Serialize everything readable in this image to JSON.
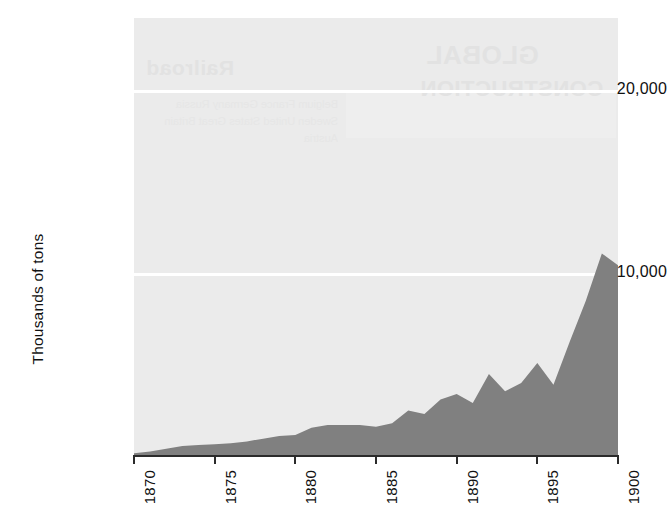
{
  "chart_data": {
    "type": "area",
    "title": "",
    "subtitle": "",
    "xlabel": "",
    "ylabel": "Thousands of tons",
    "xlim": [
      1870,
      1900
    ],
    "ylim": [
      0,
      24000
    ],
    "grid": true,
    "legend": "none",
    "fill_color": "#808080",
    "panel_color": "#ebebeb",
    "gridline_color": "#ffffff",
    "x_tick_labels": [
      "1870",
      "1875",
      "1880",
      "1885",
      "1890",
      "1895",
      "1900"
    ],
    "x_tick_values": [
      1870,
      1875,
      1880,
      1885,
      1890,
      1895,
      1900
    ],
    "y_tick_labels": [
      "20,000",
      "10,000"
    ],
    "y_tick_values": [
      20000,
      10000
    ],
    "x": [
      1870,
      1871,
      1872,
      1873,
      1874,
      1875,
      1876,
      1877,
      1878,
      1879,
      1880,
      1881,
      1882,
      1883,
      1884,
      1885,
      1886,
      1887,
      1888,
      1889,
      1890,
      1891,
      1892,
      1893,
      1894,
      1895,
      1896,
      1897,
      1898,
      1899,
      1900
    ],
    "values": [
      150,
      250,
      400,
      550,
      600,
      650,
      700,
      800,
      950,
      1100,
      1150,
      1550,
      1700,
      1700,
      1700,
      1600,
      1800,
      2500,
      2300,
      3100,
      3400,
      2900,
      4500,
      3550,
      4000,
      5100,
      3900,
      6250,
      8500,
      11100,
      10450
    ],
    "series": [
      {
        "name": "Steel production",
        "values": [
          150,
          250,
          400,
          550,
          600,
          650,
          700,
          800,
          950,
          1100,
          1150,
          1550,
          1700,
          1700,
          1700,
          1600,
          1800,
          2500,
          2300,
          3100,
          3400,
          2900,
          4500,
          3550,
          4000,
          5100,
          3900,
          6250,
          8500,
          11100,
          10450
        ]
      }
    ],
    "annotations": []
  },
  "axes": {
    "y_title": "Thousands of tons",
    "y_ticks": [
      {
        "label": "20,000"
      },
      {
        "label": "10,000"
      }
    ],
    "x_ticks": [
      {
        "label": "1870"
      },
      {
        "label": "1875"
      },
      {
        "label": "1880"
      },
      {
        "label": "1885"
      },
      {
        "label": "1890"
      },
      {
        "label": "1895"
      },
      {
        "label": "1900"
      }
    ]
  },
  "page_bleed": {
    "line1": "Railroad",
    "line2": "GLOBAL",
    "line3": "CONSTRUCTION",
    "column": "Belgium France Germany Russia Sweden United States Great Britain Austria"
  }
}
